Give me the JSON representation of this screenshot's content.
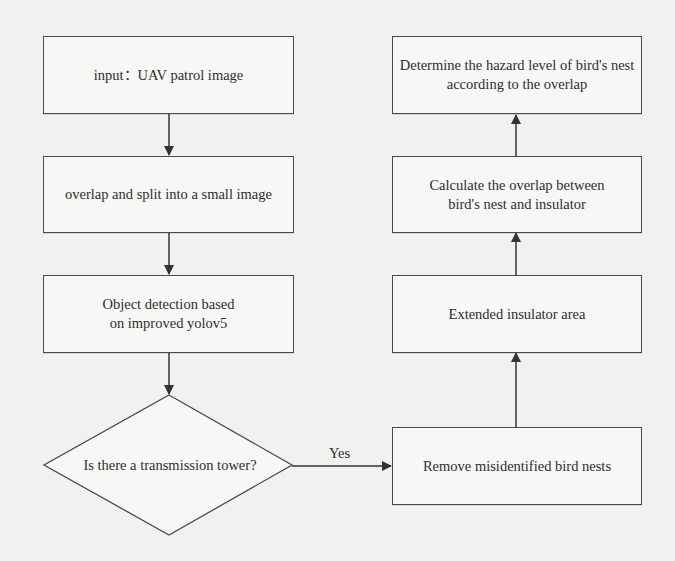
{
  "diagram": {
    "type": "flowchart",
    "colors": {
      "background": "#f1f1ef",
      "node_fill": "#f7f7f5",
      "stroke": "#4a4a4a",
      "text": "#2e2e2e"
    },
    "nodes": {
      "input": {
        "label": "input：UAV patrol image",
        "shape": "rectangle"
      },
      "split": {
        "label": "overlap and split into a small image",
        "shape": "rectangle"
      },
      "detect": {
        "label": "Object detection based on improved yolov5",
        "shape": "rectangle"
      },
      "decision": {
        "label": "Is there a transmission tower?",
        "shape": "diamond"
      },
      "remove": {
        "label": "Remove misidentified bird nests",
        "shape": "rectangle"
      },
      "extend": {
        "label": "Extended insulator area",
        "shape": "rectangle"
      },
      "overlap": {
        "label": "Calculate the overlap between bird's nest and insulator",
        "shape": "rectangle"
      },
      "hazard": {
        "label": "Determine the hazard level of bird's nest according to the overlap",
        "shape": "rectangle"
      }
    },
    "edges": [
      {
        "from": "input",
        "to": "split",
        "label": ""
      },
      {
        "from": "split",
        "to": "detect",
        "label": ""
      },
      {
        "from": "detect",
        "to": "decision",
        "label": ""
      },
      {
        "from": "decision",
        "to": "remove",
        "label": "Yes"
      },
      {
        "from": "remove",
        "to": "extend",
        "label": ""
      },
      {
        "from": "extend",
        "to": "overlap",
        "label": ""
      },
      {
        "from": "overlap",
        "to": "hazard",
        "label": ""
      }
    ],
    "edge_labels": {
      "yes": "Yes"
    }
  }
}
